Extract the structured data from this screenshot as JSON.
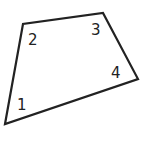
{
  "diagram": {
    "type": "quadrilateral",
    "stroke_color": "#222222",
    "vertices": [
      {
        "x": 5,
        "y": 124
      },
      {
        "x": 23,
        "y": 24
      },
      {
        "x": 103,
        "y": 13
      },
      {
        "x": 138,
        "y": 79
      }
    ],
    "angle_labels": [
      {
        "text": "1",
        "x": 17,
        "y": 110
      },
      {
        "text": "2",
        "x": 28,
        "y": 45
      },
      {
        "text": "3",
        "x": 91,
        "y": 35
      },
      {
        "text": "4",
        "x": 111,
        "y": 78
      }
    ]
  }
}
